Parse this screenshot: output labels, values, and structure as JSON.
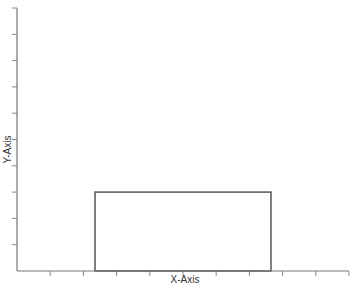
{
  "chart_data": {
    "type": "bar",
    "title": "",
    "xlabel": "X-Axis",
    "ylabel": "Y-Axis",
    "xlim": [
      0,
      10
    ],
    "ylim": [
      0,
      10
    ],
    "x_ticks": [
      1,
      2,
      3,
      4,
      5,
      6,
      7,
      8,
      9,
      10
    ],
    "y_ticks": [
      1,
      2,
      3,
      4,
      5,
      6,
      7,
      8,
      9,
      10
    ],
    "tick_labels_shown": false,
    "grid": false,
    "bars": [
      {
        "x_start": 2.35,
        "x_end": 7.65,
        "value": 3.0
      }
    ],
    "colors": {
      "axis": "#777777",
      "bar_edge": "#555555",
      "bar_fill": "#ffffff"
    }
  }
}
